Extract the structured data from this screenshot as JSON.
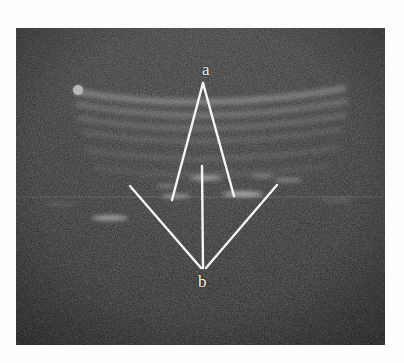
{
  "figure": {
    "kind": "ultrasound-b-mode-image",
    "modality": "B-mode ultrasound",
    "border_color": "#ffffff",
    "background_color": "#1a1a1a"
  },
  "image": {
    "frame": {
      "x": 16,
      "y": 28,
      "width": 369,
      "height": 317
    },
    "speckle_base_color": "#242424",
    "speckle_bright_color": "#c9c9c9"
  },
  "annotations": {
    "labels": [
      {
        "id": "a",
        "text": "a",
        "x": 186,
        "y": 33,
        "color": "#f2f2f2"
      },
      {
        "id": "b",
        "text": "b",
        "x": 182,
        "y": 245,
        "color": "#f2f2f2"
      }
    ],
    "apex_top": {
      "x": 203,
      "y": 83
    },
    "apex_bottom": {
      "x": 203,
      "y": 268
    },
    "line_color": "#f5f5f5",
    "line_width": 2.4,
    "measurement_lines": [
      {
        "name": "upper-v-left",
        "x1": 203,
        "y1": 83,
        "x2": 172,
        "y2": 200
      },
      {
        "name": "upper-v-right",
        "x1": 203,
        "y1": 83,
        "x2": 234,
        "y2": 196
      },
      {
        "name": "lower-v-left",
        "x1": 130,
        "y1": 186,
        "x2": 201,
        "y2": 268
      },
      {
        "name": "lower-v-right",
        "x1": 277,
        "y1": 185,
        "x2": 206,
        "y2": 268
      },
      {
        "name": "vertical-axis",
        "x1": 202,
        "y1": 166,
        "x2": 203,
        "y2": 268
      }
    ],
    "marker_dot": {
      "name": "probe-orientation-marker",
      "x": 78,
      "y": 90,
      "r": 5,
      "color": "#b9b9b9"
    }
  },
  "tissue_bands": [
    {
      "name": "band-1-skin",
      "y_left": 92,
      "y_mid": 108,
      "y_right": 88,
      "thickness": 5.0,
      "opacity": 0.62
    },
    {
      "name": "band-2-subcutis",
      "y_left": 104,
      "y_mid": 122,
      "y_right": 101,
      "thickness": 4.2,
      "opacity": 0.55
    },
    {
      "name": "band-3-fascia",
      "y_left": 118,
      "y_mid": 134,
      "y_right": 115,
      "thickness": 3.6,
      "opacity": 0.5
    },
    {
      "name": "band-4-muscle-sup",
      "y_left": 132,
      "y_mid": 146,
      "y_right": 129,
      "thickness": 3.2,
      "opacity": 0.44
    },
    {
      "name": "band-5-muscle-deep",
      "y_left": 150,
      "y_mid": 162,
      "y_right": 148,
      "thickness": 3.0,
      "opacity": 0.42
    },
    {
      "name": "band-6-interface",
      "y_left": 168,
      "y_mid": 176,
      "y_right": 166,
      "thickness": 2.6,
      "opacity": 0.38
    }
  ],
  "bright_foci": [
    {
      "name": "focus-left-deep",
      "cx": 110,
      "cy": 218,
      "rx": 18,
      "ry": 2.4,
      "opacity": 0.7
    },
    {
      "name": "focus-center-left",
      "cx": 176,
      "cy": 196,
      "rx": 14,
      "ry": 2.0,
      "opacity": 0.62
    },
    {
      "name": "focus-center",
      "cx": 206,
      "cy": 178,
      "rx": 16,
      "ry": 2.2,
      "opacity": 0.66
    },
    {
      "name": "focus-right",
      "cx": 243,
      "cy": 194,
      "rx": 20,
      "ry": 2.4,
      "opacity": 0.74
    },
    {
      "name": "focus-right-far",
      "cx": 288,
      "cy": 180,
      "rx": 14,
      "ry": 2.0,
      "opacity": 0.55
    }
  ],
  "scanline_artifact": {
    "name": "horizontal-scanline",
    "y": 197,
    "opacity": 0.22
  }
}
